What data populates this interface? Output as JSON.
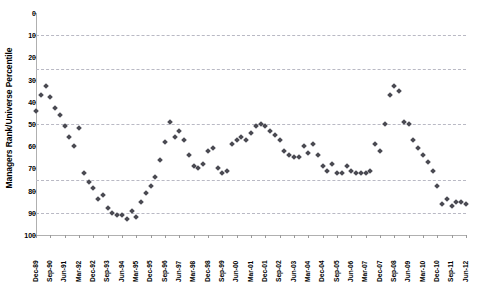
{
  "chart_data": {
    "type": "scatter",
    "title": "",
    "xlabel": "",
    "ylabel": "Managers Rank/Universe Percentile",
    "ylim": [
      0,
      100
    ],
    "y_inverted": true,
    "grid": true,
    "gridlines": [
      10,
      25,
      50,
      75,
      90
    ],
    "legend": "none",
    "marker_color": "#4a4a52",
    "marker_shape": "diamond",
    "y_ticks": [
      0,
      10,
      20,
      30,
      40,
      50,
      60,
      70,
      80,
      90,
      100
    ],
    "x_tick_labels": [
      "Dec-89",
      "Sep-90",
      "Jun-91",
      "Mar-92",
      "Dec-92",
      "Sep-93",
      "Jun-94",
      "Mar-95",
      "Dec-95",
      "Sep-96",
      "Jun-97",
      "Mar-98",
      "Dec-98",
      "Sep-99",
      "Jun-00",
      "Mar-01",
      "Dec-01",
      "Sep-02",
      "Jun-03",
      "Mar-04",
      "Dec-04",
      "Sep-05",
      "Jun-06",
      "Mar-07",
      "Dec-07",
      "Sep-08",
      "Jun-09",
      "Mar-10",
      "Dec-10",
      "Sep-11",
      "Jun-12"
    ],
    "x_tick_label_interval_quarters": 3,
    "x_start": "Dec-89",
    "x_end": "Jun-12",
    "points": [
      {
        "x": "Dec-89",
        "y": 44
      },
      {
        "x": "Mar-90",
        "y": 37
      },
      {
        "x": "Jun-90",
        "y": 33
      },
      {
        "x": "Sep-90",
        "y": 38
      },
      {
        "x": "Dec-90",
        "y": 43
      },
      {
        "x": "Mar-91",
        "y": 46
      },
      {
        "x": "Jun-91",
        "y": 51
      },
      {
        "x": "Sep-91",
        "y": 56
      },
      {
        "x": "Dec-91",
        "y": 60
      },
      {
        "x": "Mar-92",
        "y": 52
      },
      {
        "x": "Jun-92",
        "y": 72
      },
      {
        "x": "Sep-92",
        "y": 76
      },
      {
        "x": "Dec-92",
        "y": 79
      },
      {
        "x": "Mar-93",
        "y": 84
      },
      {
        "x": "Jun-93",
        "y": 82
      },
      {
        "x": "Sep-93",
        "y": 88
      },
      {
        "x": "Dec-93",
        "y": 90
      },
      {
        "x": "Mar-94",
        "y": 91
      },
      {
        "x": "Jun-94",
        "y": 91
      },
      {
        "x": "Sep-94",
        "y": 93
      },
      {
        "x": "Dec-94",
        "y": 89
      },
      {
        "x": "Mar-95",
        "y": 92
      },
      {
        "x": "Jun-95",
        "y": 85
      },
      {
        "x": "Sep-95",
        "y": 81
      },
      {
        "x": "Dec-95",
        "y": 78
      },
      {
        "x": "Mar-96",
        "y": 74
      },
      {
        "x": "Jun-96",
        "y": 66
      },
      {
        "x": "Sep-96",
        "y": 58
      },
      {
        "x": "Dec-96",
        "y": 49
      },
      {
        "x": "Mar-97",
        "y": 56
      },
      {
        "x": "Jun-97",
        "y": 53
      },
      {
        "x": "Sep-97",
        "y": 57
      },
      {
        "x": "Dec-97",
        "y": 64
      },
      {
        "x": "Mar-98",
        "y": 69
      },
      {
        "x": "Jun-98",
        "y": 70
      },
      {
        "x": "Sep-98",
        "y": 68
      },
      {
        "x": "Dec-98",
        "y": 62
      },
      {
        "x": "Mar-99",
        "y": 61
      },
      {
        "x": "Jun-99",
        "y": 70
      },
      {
        "x": "Sep-99",
        "y": 72
      },
      {
        "x": "Dec-99",
        "y": 71
      },
      {
        "x": "Mar-00",
        "y": 59
      },
      {
        "x": "Jun-00",
        "y": 57
      },
      {
        "x": "Sep-00",
        "y": 56
      },
      {
        "x": "Dec-00",
        "y": 57
      },
      {
        "x": "Mar-01",
        "y": 54
      },
      {
        "x": "Jun-01",
        "y": 51
      },
      {
        "x": "Sep-01",
        "y": 50
      },
      {
        "x": "Dec-01",
        "y": 51
      },
      {
        "x": "Mar-02",
        "y": 53
      },
      {
        "x": "Jun-02",
        "y": 55
      },
      {
        "x": "Sep-02",
        "y": 57
      },
      {
        "x": "Dec-02",
        "y": 62
      },
      {
        "x": "Mar-03",
        "y": 64
      },
      {
        "x": "Jun-03",
        "y": 65
      },
      {
        "x": "Sep-03",
        "y": 65
      },
      {
        "x": "Dec-03",
        "y": 60
      },
      {
        "x": "Mar-04",
        "y": 63
      },
      {
        "x": "Jun-04",
        "y": 59
      },
      {
        "x": "Sep-04",
        "y": 64
      },
      {
        "x": "Dec-04",
        "y": 69
      },
      {
        "x": "Mar-05",
        "y": 71
      },
      {
        "x": "Jun-05",
        "y": 68
      },
      {
        "x": "Sep-05",
        "y": 72
      },
      {
        "x": "Dec-05",
        "y": 72
      },
      {
        "x": "Mar-06",
        "y": 69
      },
      {
        "x": "Jun-06",
        "y": 71
      },
      {
        "x": "Sep-06",
        "y": 72
      },
      {
        "x": "Dec-06",
        "y": 72
      },
      {
        "x": "Mar-07",
        "y": 72
      },
      {
        "x": "Jun-07",
        "y": 71
      },
      {
        "x": "Sep-07",
        "y": 59
      },
      {
        "x": "Dec-07",
        "y": 62
      },
      {
        "x": "Mar-08",
        "y": 50
      },
      {
        "x": "Jun-08",
        "y": 37
      },
      {
        "x": "Sep-08",
        "y": 33
      },
      {
        "x": "Dec-08",
        "y": 35
      },
      {
        "x": "Mar-09",
        "y": 49
      },
      {
        "x": "Jun-09",
        "y": 50
      },
      {
        "x": "Sep-09",
        "y": 57
      },
      {
        "x": "Dec-09",
        "y": 61
      },
      {
        "x": "Mar-10",
        "y": 64
      },
      {
        "x": "Jun-10",
        "y": 67
      },
      {
        "x": "Sep-10",
        "y": 71
      },
      {
        "x": "Dec-10",
        "y": 78
      },
      {
        "x": "Mar-11",
        "y": 86
      },
      {
        "x": "Jun-11",
        "y": 84
      },
      {
        "x": "Sep-11",
        "y": 87
      },
      {
        "x": "Dec-11",
        "y": 85
      },
      {
        "x": "Mar-12",
        "y": 85
      },
      {
        "x": "Jun-12",
        "y": 86
      }
    ]
  }
}
